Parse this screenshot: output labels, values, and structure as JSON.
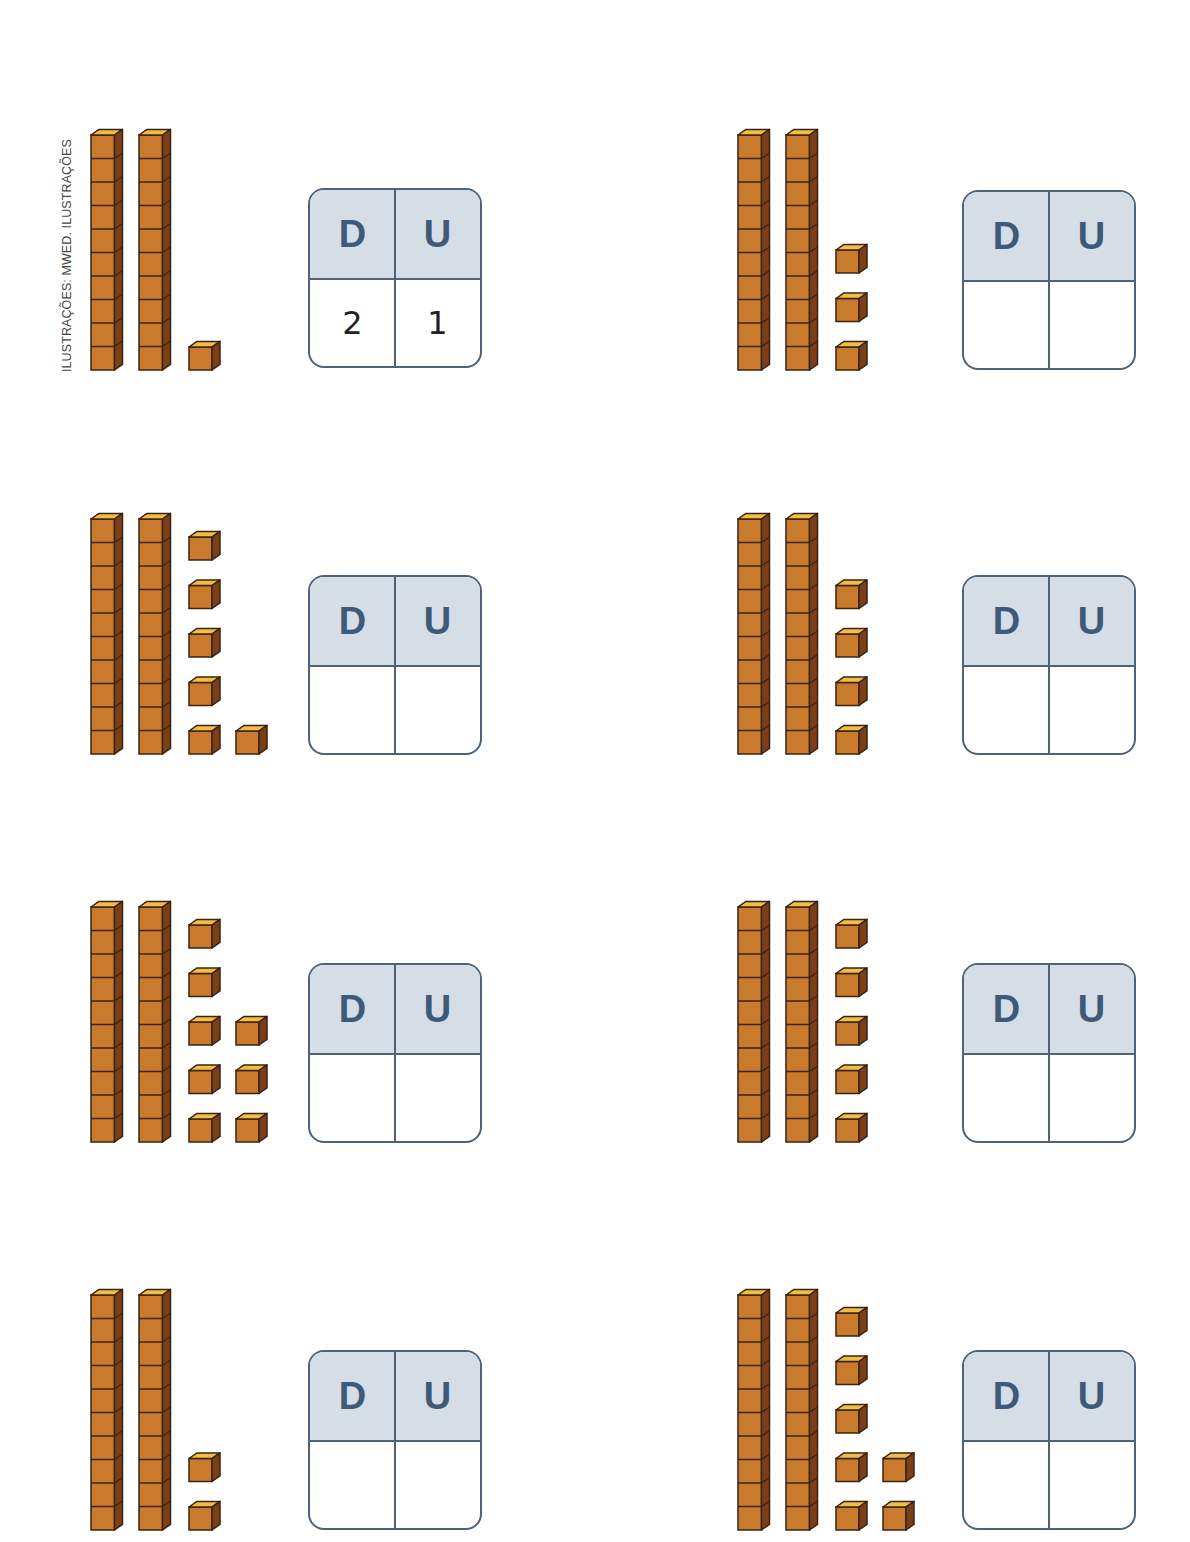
{
  "credit": "ILUSTRAÇÕES: MWED. ILUSTRAÇÕES",
  "colors": {
    "cube_front": "#c97a2c",
    "cube_top": "#f0bd45",
    "cube_side": "#7a3f17",
    "cube_outline": "#3a2410",
    "table_header_bg": "#d5dde7",
    "table_border": "#4e6378",
    "table_label": "#3f5a78"
  },
  "table_headers": {
    "tens": "D",
    "units": "U"
  },
  "exercises": [
    {
      "id": "a",
      "tens_rods": 2,
      "unit_cubes": 1,
      "answer": {
        "tens": "2",
        "units": "1"
      }
    },
    {
      "id": "b",
      "tens_rods": 2,
      "unit_cubes": 3,
      "answer": {
        "tens": "",
        "units": ""
      }
    },
    {
      "id": "c",
      "tens_rods": 2,
      "unit_cubes": 6,
      "answer": {
        "tens": "",
        "units": ""
      }
    },
    {
      "id": "d",
      "tens_rods": 2,
      "unit_cubes": 4,
      "answer": {
        "tens": "",
        "units": ""
      }
    },
    {
      "id": "e",
      "tens_rods": 2,
      "unit_cubes": 8,
      "answer": {
        "tens": "",
        "units": ""
      }
    },
    {
      "id": "f",
      "tens_rods": 2,
      "unit_cubes": 5,
      "answer": {
        "tens": "",
        "units": ""
      }
    },
    {
      "id": "g",
      "tens_rods": 2,
      "unit_cubes": 2,
      "answer": {
        "tens": "",
        "units": ""
      }
    },
    {
      "id": "h",
      "tens_rods": 2,
      "unit_cubes": 7,
      "answer": {
        "tens": "",
        "units": ""
      }
    }
  ]
}
